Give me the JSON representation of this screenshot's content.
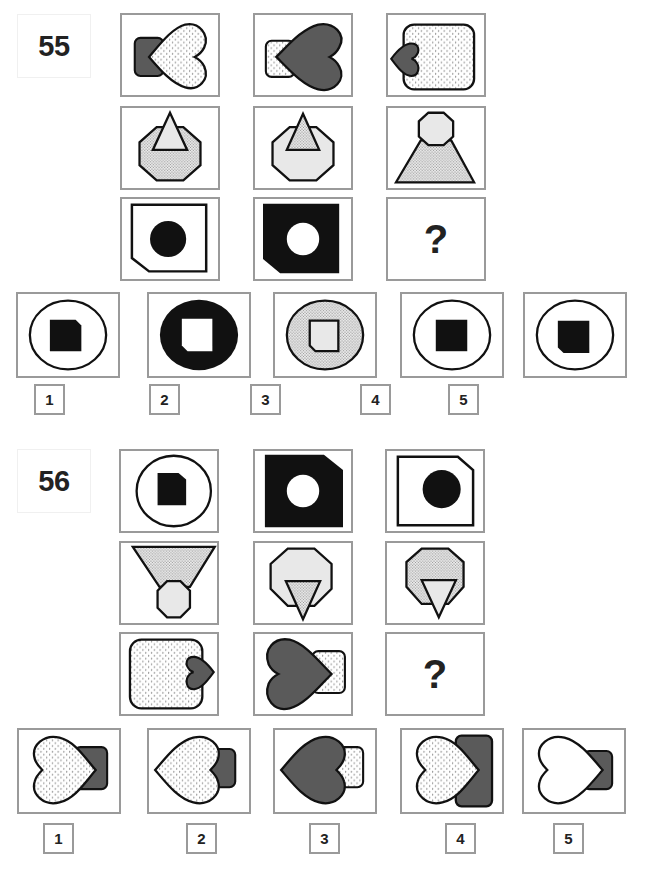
{
  "colors": {
    "frame_border": "#9a9a9a",
    "dark_fill": "#5a5a5a",
    "light_fill": "#e8e8e8",
    "black": "#111111",
    "outline": "#111111"
  },
  "problems": [
    {
      "number": "55",
      "matrix": [
        [
          "heart-dotted-over-dark-rect",
          "dark-heart-over-dotted-rect",
          "small-dark-heart-left-of-dotted-rounded-square"
        ],
        [
          "dotted-octagon-with-light-triangle",
          "light-octagon-with-dotted-triangle",
          "light-octagon-on-dotted-trapezoid"
        ],
        [
          "white-square-clipped-bottom-left-with-black-circle",
          "black-square-clipped-bottom-left-with-white-circle",
          "?"
        ]
      ],
      "missing_label": "?",
      "options": [
        {
          "label": "1",
          "desc": "white-circle-with-black-square-clipped-top-right"
        },
        {
          "label": "2",
          "desc": "black-circle-with-white-square-clipped-bottom-left"
        },
        {
          "label": "3",
          "desc": "dotted-circle-with-light-square-clipped-bottom-left"
        },
        {
          "label": "4",
          "desc": "white-circle-with-black-square"
        },
        {
          "label": "5",
          "desc": "white-circle-with-black-square-clipped-bottom-left"
        }
      ]
    },
    {
      "number": "56",
      "matrix": [
        [
          "white-circle-with-black-square-clipped-top-right",
          "black-square-clipped-top-right-with-white-circle",
          "white-square-clipped-top-right-with-black-circle"
        ],
        [
          "dotted-inverted-trapezoid-over-light-octagon",
          "light-octagon-with-dotted-inverted-triangle",
          "dotted-octagon-with-light-inverted-triangle"
        ],
        [
          "dotted-rounded-square-with-small-dark-heart-right",
          "dark-heart-over-dotted-rect",
          "?"
        ]
      ],
      "missing_label": "?",
      "options": [
        {
          "label": "1",
          "desc": "dotted-heart-pointing-right-over-dark-rect"
        },
        {
          "label": "2",
          "desc": "dotted-heart-pointing-left-over-dark-rect"
        },
        {
          "label": "3",
          "desc": "dark-heart-pointing-left-over-dotted-rect"
        },
        {
          "label": "4",
          "desc": "dotted-heart-pointing-right-over-large-dark-rect"
        },
        {
          "label": "5",
          "desc": "white-heart-pointing-right-over-dark-rect"
        }
      ]
    }
  ]
}
